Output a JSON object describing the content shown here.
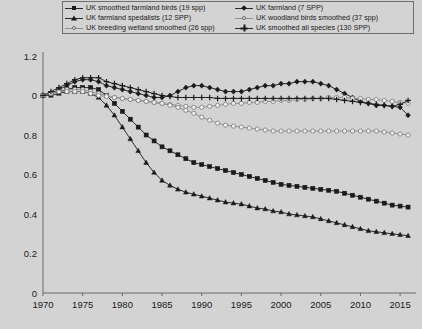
{
  "legend": {
    "items": [
      {
        "label": "UK smoothed farmland birds (19 spp)",
        "marker": "sq",
        "tone": "dark"
      },
      {
        "label": "UK farmland (7 SPP)",
        "marker": "dia",
        "tone": "dark"
      },
      {
        "label": "UK farmland spedalists (12 SPP)",
        "marker": "tri",
        "tone": "dark"
      },
      {
        "label": "UK woodland birds smoothed (37 spp)",
        "marker": "circ",
        "tone": "light"
      },
      {
        "label": "UK breeding wetland smoothed (26 spp)",
        "marker": "circ",
        "tone": "light"
      },
      {
        "label": "UK smoothed all species (130 SPP)",
        "marker": "plus",
        "tone": "dark"
      }
    ]
  },
  "chart_data": {
    "type": "line",
    "title": "",
    "xlabel": "",
    "ylabel": "",
    "xlim": [
      1970,
      2017
    ],
    "ylim": [
      0,
      1.2
    ],
    "grid": false,
    "legend_position": "top",
    "xticks": [
      1970,
      1975,
      1980,
      1985,
      1990,
      1995,
      2000,
      2005,
      2010,
      2015
    ],
    "yticks": [
      0,
      0.2,
      0.4,
      0.6,
      0.8,
      1.0,
      1.2
    ],
    "ytick_labels": [
      "0",
      "0.2",
      "0.4",
      "0.6",
      "0.8",
      "0",
      "1.2"
    ],
    "x": [
      1970,
      1971,
      1972,
      1973,
      1974,
      1975,
      1976,
      1977,
      1978,
      1979,
      1980,
      1981,
      1982,
      1983,
      1984,
      1985,
      1986,
      1987,
      1988,
      1989,
      1990,
      1991,
      1992,
      1993,
      1994,
      1995,
      1996,
      1997,
      1998,
      1999,
      2000,
      2001,
      2002,
      2003,
      2004,
      2005,
      2006,
      2007,
      2008,
      2009,
      2010,
      2011,
      2012,
      2013,
      2014,
      2015,
      2016
    ],
    "series": [
      {
        "name": "UK smoothed farmland birds (19 spp)",
        "marker": "sq",
        "tone": "dark",
        "values": [
          1.0,
          1.01,
          1.02,
          1.03,
          1.04,
          1.04,
          1.04,
          1.03,
          1.0,
          0.96,
          0.92,
          0.88,
          0.84,
          0.8,
          0.77,
          0.74,
          0.72,
          0.7,
          0.68,
          0.66,
          0.65,
          0.64,
          0.63,
          0.62,
          0.61,
          0.6,
          0.59,
          0.58,
          0.57,
          0.56,
          0.55,
          0.545,
          0.54,
          0.535,
          0.53,
          0.525,
          0.52,
          0.515,
          0.505,
          0.495,
          0.485,
          0.475,
          0.465,
          0.455,
          0.445,
          0.44,
          0.435
        ]
      },
      {
        "name": "UK farmland (7 SPP)",
        "marker": "dia",
        "tone": "dark",
        "values": [
          1.0,
          1.01,
          1.03,
          1.05,
          1.07,
          1.08,
          1.08,
          1.07,
          1.05,
          1.04,
          1.03,
          1.02,
          1.01,
          1.0,
          0.99,
          0.99,
          1.0,
          1.02,
          1.04,
          1.05,
          1.05,
          1.04,
          1.03,
          1.02,
          1.02,
          1.02,
          1.03,
          1.04,
          1.05,
          1.05,
          1.06,
          1.06,
          1.07,
          1.07,
          1.07,
          1.06,
          1.05,
          1.03,
          1.01,
          0.99,
          0.97,
          0.96,
          0.95,
          0.95,
          0.945,
          0.94,
          0.9
        ]
      },
      {
        "name": "UK farmland spedalists (12 SPP)",
        "marker": "tri",
        "tone": "dark",
        "values": [
          1.0,
          1.0,
          1.01,
          1.02,
          1.02,
          1.02,
          1.01,
          0.99,
          0.95,
          0.9,
          0.84,
          0.78,
          0.72,
          0.66,
          0.61,
          0.57,
          0.545,
          0.525,
          0.51,
          0.5,
          0.49,
          0.48,
          0.47,
          0.46,
          0.455,
          0.45,
          0.44,
          0.43,
          0.425,
          0.415,
          0.41,
          0.4,
          0.395,
          0.39,
          0.385,
          0.375,
          0.365,
          0.355,
          0.345,
          0.335,
          0.325,
          0.315,
          0.31,
          0.305,
          0.3,
          0.295,
          0.29
        ]
      },
      {
        "name": "UK woodland birds smoothed (37 spp)",
        "marker": "circ",
        "tone": "light",
        "values": [
          1.0,
          1.01,
          1.02,
          1.03,
          1.03,
          1.03,
          1.02,
          1.01,
          1.0,
          0.99,
          0.985,
          0.98,
          0.975,
          0.97,
          0.965,
          0.96,
          0.955,
          0.95,
          0.945,
          0.94,
          0.94,
          0.945,
          0.95,
          0.955,
          0.96,
          0.96,
          0.965,
          0.965,
          0.97,
          0.97,
          0.975,
          0.975,
          0.98,
          0.98,
          0.985,
          0.985,
          0.99,
          0.99,
          0.99,
          0.985,
          0.985,
          0.98,
          0.98,
          0.975,
          0.97,
          0.965,
          0.96
        ]
      },
      {
        "name": "UK breeding wetland smoothed (26 spp)",
        "marker": "circ",
        "tone": "light",
        "values": [
          1.0,
          1.01,
          1.02,
          1.02,
          1.02,
          1.02,
          1.01,
          1.0,
          0.995,
          0.99,
          0.985,
          0.98,
          0.975,
          0.97,
          0.965,
          0.96,
          0.95,
          0.94,
          0.925,
          0.91,
          0.89,
          0.875,
          0.86,
          0.85,
          0.845,
          0.84,
          0.835,
          0.83,
          0.825,
          0.82,
          0.82,
          0.82,
          0.82,
          0.82,
          0.82,
          0.82,
          0.82,
          0.82,
          0.82,
          0.82,
          0.82,
          0.82,
          0.82,
          0.815,
          0.81,
          0.805,
          0.8
        ]
      },
      {
        "name": "UK smoothed all species (130 SPP)",
        "marker": "plus",
        "tone": "dark",
        "values": [
          1.0,
          1.02,
          1.04,
          1.06,
          1.08,
          1.09,
          1.09,
          1.09,
          1.07,
          1.06,
          1.05,
          1.04,
          1.03,
          1.02,
          1.01,
          1.0,
          0.995,
          0.99,
          0.99,
          0.99,
          0.99,
          0.99,
          0.985,
          0.985,
          0.985,
          0.985,
          0.985,
          0.985,
          0.985,
          0.985,
          0.985,
          0.985,
          0.985,
          0.985,
          0.985,
          0.985,
          0.985,
          0.98,
          0.975,
          0.97,
          0.965,
          0.96,
          0.955,
          0.95,
          0.945,
          0.955,
          0.975
        ]
      }
    ]
  }
}
